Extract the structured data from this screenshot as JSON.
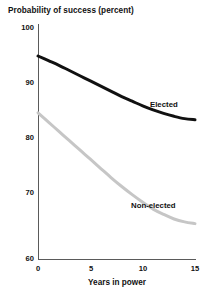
{
  "chart_data": {
    "type": "line",
    "title": "Probability of success (percent)",
    "xlabel": "Years in power",
    "ylabel": "",
    "xlim": [
      0,
      15
    ],
    "ylim": [
      60,
      100
    ],
    "grid": false,
    "legend_position": "inline-annotations",
    "xticks": [
      "0",
      "5",
      "10",
      "15"
    ],
    "xtick_values": [
      0,
      5,
      10,
      15
    ],
    "yticks": [
      "60",
      "70",
      "80",
      "90",
      "100"
    ],
    "ytick_values": [
      60,
      70,
      80,
      90,
      100
    ],
    "x": [
      0,
      1,
      2,
      3,
      4,
      5,
      6,
      7,
      8,
      9,
      10,
      11,
      12,
      13,
      14,
      15
    ],
    "series": [
      {
        "name": "Elected",
        "color": "#111111",
        "line_width": 3.0,
        "values": [
          95.0,
          94.2,
          93.4,
          92.5,
          91.6,
          90.7,
          89.8,
          88.9,
          88.0,
          87.2,
          86.4,
          85.7,
          85.1,
          84.6,
          84.2,
          84.0
        ]
      },
      {
        "name": "Non-elected",
        "color": "#c6c6c6",
        "line_width": 3.0,
        "values": [
          85.2,
          83.6,
          82.0,
          80.4,
          78.8,
          77.2,
          75.6,
          74.0,
          72.5,
          71.1,
          69.8,
          68.6,
          67.7,
          66.9,
          66.4,
          66.1
        ]
      }
    ],
    "annotations": [
      {
        "text": "Elected",
        "x": 13.0,
        "y": 88.0
      },
      {
        "text": "Non-elected",
        "x": 11.0,
        "y": 71.5
      }
    ]
  },
  "axis_colors": {
    "spine": "#5a5a5a",
    "text": "#111111",
    "background": "#ffffff"
  }
}
